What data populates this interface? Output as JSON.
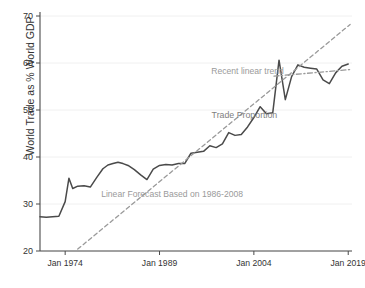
{
  "chart_data": {
    "type": "line",
    "title": "",
    "xlabel": "",
    "ylabel": "World Trade as % World GDP",
    "xlim": [
      1970,
      2019.6
    ],
    "ylim": [
      20,
      70
    ],
    "grid": true,
    "legend_position": "inline-annotations",
    "xticks": [
      {
        "value": 1974,
        "label": "Jan 1974"
      },
      {
        "value": 1989,
        "label": "Jan 1989"
      },
      {
        "value": 2004,
        "label": "Jan 2004"
      },
      {
        "value": 2019,
        "label": "Jan 2019"
      }
    ],
    "yticks": [
      {
        "value": 20,
        "label": "20"
      },
      {
        "value": 30,
        "label": "30"
      },
      {
        "value": 40,
        "label": "40"
      },
      {
        "value": 50,
        "label": "50"
      },
      {
        "value": 60,
        "label": "60"
      },
      {
        "value": 70,
        "label": "70"
      }
    ],
    "annotations": [
      {
        "name": "recent-linear-trend",
        "text": "Recent linear trend",
        "x": 2003.0,
        "y": 57.6,
        "color": "#9a9a9a"
      },
      {
        "name": "trade-proportion",
        "text": "Trade Proportion",
        "x": 2002.5,
        "y": 48.2,
        "color": "#808080"
      },
      {
        "name": "linear-forecast",
        "text": "Linear Forecast Based on 1986-2008",
        "x": 1991.0,
        "y": 31.5,
        "color": "#9a9a9a"
      }
    ],
    "series": [
      {
        "name": "Trade Proportion",
        "style": "solid",
        "color": "#4a4a4a",
        "x": [
          1970.0,
          1971.0,
          1972.0,
          1973.0,
          1974.0,
          1974.6,
          1975.2,
          1976.0,
          1977.0,
          1978.0,
          1979.0,
          1980.0,
          1980.8,
          1981.6,
          1982.4,
          1983.2,
          1984.0,
          1985.0,
          1986.0,
          1987.0,
          1988.0,
          1989.0,
          1990.0,
          1991.0,
          1992.0,
          1993.0,
          1994.0,
          1995.0,
          1996.0,
          1997.0,
          1998.0,
          1999.0,
          2000.0,
          2001.0,
          2002.0,
          2003.0,
          2004.0,
          2005.0,
          2006.0,
          2007.0,
          2008.0,
          2009.0,
          2010.0,
          2011.0,
          2012.0,
          2013.0,
          2014.0,
          2015.0,
          2016.0,
          2017.0,
          2018.0,
          2019.0
        ],
        "y": [
          27.3,
          27.2,
          27.3,
          27.4,
          30.5,
          35.5,
          33.3,
          33.8,
          33.9,
          33.6,
          35.6,
          37.5,
          38.3,
          38.6,
          38.9,
          38.6,
          38.2,
          37.3,
          36.2,
          35.2,
          37.4,
          38.2,
          38.4,
          38.3,
          38.6,
          38.6,
          40.8,
          41.0,
          41.2,
          42.4,
          42.0,
          42.8,
          45.2,
          44.6,
          44.8,
          46.4,
          48.4,
          50.7,
          49.2,
          49.4,
          60.6,
          52.2,
          57.1,
          59.6,
          59.1,
          58.9,
          58.7,
          56.4,
          55.6,
          57.9,
          59.3,
          59.8
        ]
      },
      {
        "name": "Linear Forecast Based on 1986-2008",
        "style": "dashed",
        "color": "#9a9a9a",
        "x": [
          1976.0,
          2019.3
        ],
        "y": [
          20.4,
          68.2
        ]
      },
      {
        "name": "Recent linear trend",
        "style": "dash-dot",
        "color": "#9a9a9a",
        "x": [
          2007.2,
          2019.3
        ],
        "y": [
          57.2,
          58.6
        ]
      }
    ]
  },
  "axes": {
    "y_axis_title": "World Trade as % World GDP"
  }
}
